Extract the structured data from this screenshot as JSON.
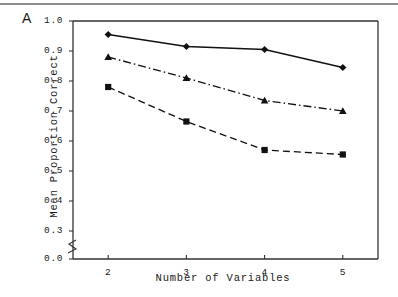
{
  "panel": {
    "label": "A"
  },
  "chart_data": {
    "type": "line",
    "title": "",
    "panel_label": "A",
    "xlabel": "Number of Variables",
    "ylabel": "Mean Proportion Correct",
    "x": [
      2,
      3,
      4,
      5
    ],
    "categories": [
      "2",
      "3",
      "4",
      "5"
    ],
    "xlim": [
      1.55,
      5.45
    ],
    "ylim": [
      0.0,
      1.0
    ],
    "y_axis_break": {
      "present": true,
      "between": [
        0.0,
        0.3
      ]
    },
    "ytick_labels": [
      "0.0",
      "0.3",
      "0.4",
      "0.5",
      "0.6",
      "0.7",
      "0.8",
      "0.9",
      "1.0"
    ],
    "ytick_values": [
      0.0,
      0.3,
      0.4,
      0.5,
      0.6,
      0.7,
      0.8,
      0.9,
      1.0
    ],
    "xtick_labels": [
      "2",
      "3",
      "4",
      "5"
    ],
    "grid": false,
    "legend": "none",
    "series": [
      {
        "name": "Series 1",
        "marker": "diamond",
        "line_style": "solid",
        "color": "#111111",
        "values": [
          0.955,
          0.915,
          0.905,
          0.845
        ]
      },
      {
        "name": "Series 2",
        "marker": "triangle",
        "line_style": "dash-dot",
        "color": "#111111",
        "values": [
          0.88,
          0.81,
          0.735,
          0.7
        ]
      },
      {
        "name": "Series 3",
        "marker": "square",
        "line_style": "dashed",
        "color": "#111111",
        "values": [
          0.78,
          0.665,
          0.57,
          0.555
        ]
      }
    ]
  },
  "axes": {
    "y_ticks": [
      {
        "label": "0.0",
        "value": 0.0
      },
      {
        "label": "0.3",
        "value": 0.3
      },
      {
        "label": "0.4",
        "value": 0.4
      },
      {
        "label": "0.5",
        "value": 0.5
      },
      {
        "label": "0.6",
        "value": 0.6
      },
      {
        "label": "0.7",
        "value": 0.7
      },
      {
        "label": "0.8",
        "value": 0.8
      },
      {
        "label": "0.9",
        "value": 0.9
      },
      {
        "label": "1.0",
        "value": 1.0
      }
    ],
    "x_ticks": [
      {
        "label": "2",
        "value": 2
      },
      {
        "label": "3",
        "value": 3
      },
      {
        "label": "4",
        "value": 4
      },
      {
        "label": "5",
        "value": 5
      }
    ],
    "xlabel": "Number of Variables",
    "ylabel": "Mean Proportion Correct"
  },
  "colors": {
    "ink": "#111111",
    "axis": "#333333",
    "top_rule": "#8e8e8e",
    "background": "#ffffff"
  }
}
